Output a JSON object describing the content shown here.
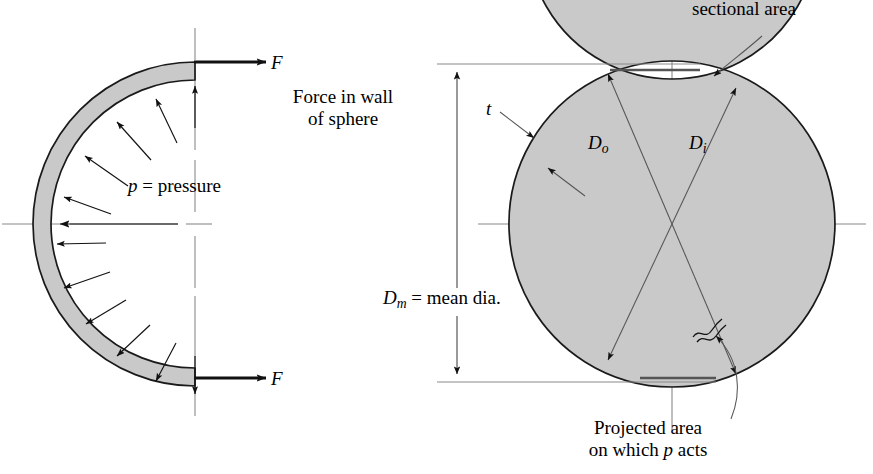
{
  "figure": {
    "title_semantic": "Pressure vessel sphere free-body and cross-section diagram",
    "colors": {
      "wall_fill": "#c9c9c9",
      "outline": "#1a1a1a",
      "centerline": "#8a8a8a",
      "leader": "#3a3a3a",
      "background": "#ffffff"
    }
  },
  "left_diagram": {
    "name": "free-body hemisphere",
    "force_label_top": "F",
    "force_label_bottom": "F",
    "force_caption_line1": "Force in wall",
    "force_caption_line2": "of sphere",
    "pressure_label_var": "p",
    "pressure_label_rest": " = pressure",
    "pressure_arrow_count": 11
  },
  "right_diagram": {
    "name": "sphere cross-section with dimensions",
    "sectional_area_label": "sectional area",
    "thickness_label": "t",
    "outer_diameter_label_var": "D",
    "outer_diameter_label_sub": "o",
    "inner_diameter_label_var": "D",
    "inner_diameter_label_sub": "i",
    "mean_diameter_label_var": "D",
    "mean_diameter_label_sub": "m",
    "mean_diameter_label_rest": " = mean dia.",
    "projected_area_line1": "Projected area",
    "projected_area_line2_pre": "on which ",
    "projected_area_line2_var": "p",
    "projected_area_line2_post": " acts"
  },
  "geometry": {
    "left_center_x": 195,
    "left_center_y": 224,
    "left_outer_radius": 162,
    "left_inner_radius": 144,
    "right_center_x": 672,
    "right_center_y": 224,
    "right_outer_radius": 163,
    "right_inner_radius": 145,
    "dimension_top_y": 64,
    "dimension_bottom_y": 382,
    "dimension_line_x": 457
  }
}
